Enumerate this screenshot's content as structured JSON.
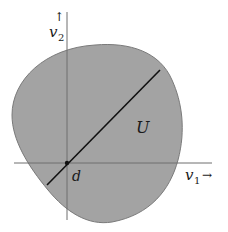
{
  "diagram": {
    "region_label": "U",
    "point_label": "d",
    "x_axis": {
      "label": "v",
      "subscript": "1",
      "arrow": "→"
    },
    "y_axis": {
      "label": "v",
      "subscript": "2",
      "arrow": "↑"
    }
  },
  "colors": {
    "region_fill": "#a3a3a3",
    "region_stroke": "#7a7a7a",
    "axis": "#6e6e6e",
    "line": "#111111",
    "text": "#1a1a1a"
  }
}
